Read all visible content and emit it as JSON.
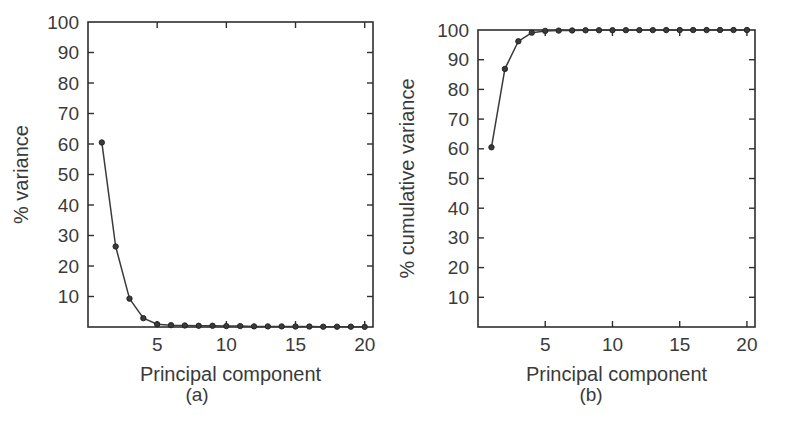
{
  "figure": {
    "background_color": "#ffffff",
    "line_color": "#3a3a3a",
    "text_color": "#3a3a3a"
  },
  "panels": [
    {
      "id": "a",
      "subcaption": "(a)",
      "chart_data": {
        "type": "line",
        "title": "",
        "xlabel": "Principal component",
        "ylabel": "% variance",
        "xlim": [
          0,
          20.6
        ],
        "ylim": [
          0,
          100
        ],
        "xticks": [
          5,
          10,
          15,
          20
        ],
        "xticklabels": [
          "5",
          "10",
          "15",
          "20"
        ],
        "yticks": [
          10,
          20,
          30,
          40,
          50,
          60,
          70,
          80,
          90,
          100
        ],
        "yticklabels": [
          "10",
          "20",
          "30",
          "40",
          "50",
          "60",
          "70",
          "80",
          "90",
          "100"
        ],
        "grid": false,
        "legend": "none",
        "marker": "filled-circle",
        "x": [
          1,
          2,
          3,
          4,
          5,
          6,
          7,
          8,
          9,
          10,
          11,
          12,
          13,
          14,
          15,
          16,
          17,
          18,
          19,
          20
        ],
        "values": [
          60.5,
          26.4,
          9.3,
          2.9,
          0.9,
          0.6,
          0.5,
          0.4,
          0.4,
          0.3,
          0.3,
          0.2,
          0.2,
          0.2,
          0.15,
          0.15,
          0.1,
          0.1,
          0.1,
          0.05
        ]
      }
    },
    {
      "id": "b",
      "subcaption": "(b)",
      "chart_data": {
        "type": "line",
        "title": "",
        "xlabel": "Principal component",
        "ylabel": "% cumulative variance",
        "xlim": [
          0,
          20.6
        ],
        "ylim": [
          0,
          100
        ],
        "xticks": [
          5,
          10,
          15,
          20
        ],
        "xticklabels": [
          "5",
          "10",
          "15",
          "20"
        ],
        "yticks": [
          10,
          20,
          30,
          40,
          50,
          60,
          70,
          80,
          90,
          100
        ],
        "yticklabels": [
          "10",
          "20",
          "30",
          "40",
          "50",
          "60",
          "70",
          "80",
          "90",
          "100"
        ],
        "grid": false,
        "legend": "none",
        "marker": "filled-circle",
        "x": [
          1,
          2,
          3,
          4,
          5,
          6,
          7,
          8,
          9,
          10,
          11,
          12,
          13,
          14,
          15,
          16,
          17,
          18,
          19,
          20
        ],
        "values": [
          60.5,
          86.9,
          96.2,
          99.1,
          99.7,
          99.8,
          99.85,
          99.9,
          99.92,
          99.94,
          99.95,
          99.96,
          99.97,
          99.98,
          99.98,
          99.99,
          99.99,
          100,
          100,
          100
        ]
      }
    }
  ]
}
